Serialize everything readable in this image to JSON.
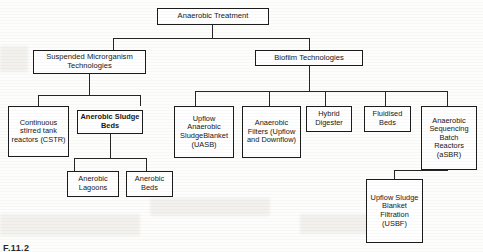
{
  "diagram": {
    "root": {
      "label": "Anaerobic Treatment"
    },
    "level2": [
      {
        "id": "suspended",
        "label": "Suspended Microrganism Technologies"
      },
      {
        "id": "biofilm",
        "label": "Biofilm Technologies"
      }
    ],
    "suspended_children": [
      {
        "id": "cstr",
        "label": "Continuous stirred tank reactors (CSTR)",
        "bold": false
      },
      {
        "id": "anerobic-sludge-beds",
        "label": "Anerobic Sludge Beds",
        "bold": true
      }
    ],
    "sludge_bed_children": [
      {
        "id": "anerobic-lagoons",
        "label": "Anerobic Lagoons"
      },
      {
        "id": "anerobic-beds",
        "label": "Anerobic Beds"
      }
    ],
    "biofilm_children": [
      {
        "id": "uasb",
        "label": "Upflow Anaerobic SludgeBlanket (UASB)"
      },
      {
        "id": "anaerobic-filters",
        "label": "Anaerobic Filters (Upflow and Downflow)"
      },
      {
        "id": "hybrid-digester",
        "label": "Hybrid Digester"
      },
      {
        "id": "fluidised-beds",
        "label": "Fluidised Beds"
      },
      {
        "id": "asbr",
        "label": "Anaerobic Sequencing Batch Reactors (aSBR)"
      }
    ],
    "asbr_children": [
      {
        "id": "usbf",
        "label": "Upflow Sludge Blanket Filtration (USBF)"
      }
    ],
    "caption": "F.11.2",
    "colors": {
      "border": "#1c1c1c",
      "line": "#262626",
      "box_fill": "#ffffff",
      "page_bg": "#fdfdfc",
      "text": "#161616"
    }
  }
}
